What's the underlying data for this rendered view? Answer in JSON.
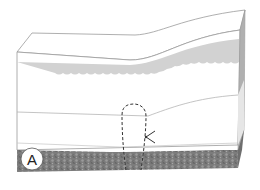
{
  "diagram": {
    "type": "block cross-section",
    "label": "A",
    "layers": [
      {
        "name": "top-surface",
        "color": "#ffffff"
      },
      {
        "name": "gray-wavy-band",
        "color": "#d4d4d4"
      },
      {
        "name": "white-middle-layer",
        "color": "#ffffff"
      },
      {
        "name": "lower-white-layer",
        "color": "#ffffff"
      },
      {
        "name": "dark-textured-base",
        "color": "#7d7d7d"
      }
    ],
    "annotations": [
      {
        "name": "dashed-outline",
        "style": "dashed loop"
      },
      {
        "name": "arrow",
        "style": "pointer arrow"
      }
    ],
    "colors": {
      "outline": "#9a9a9a",
      "gray_band": "#d2d2d2",
      "side_face": "#a8a8a8",
      "base": "#7a7a7a",
      "dash": "#333333"
    }
  }
}
